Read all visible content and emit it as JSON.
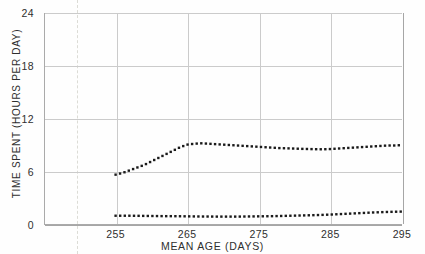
{
  "figure": {
    "background_color": "#fefefe",
    "grid_color": "#cbcbcb",
    "axis_color": "#a6a6a6",
    "series_color": "#1a1a1a",
    "marker_line_color": "#dcdcd6"
  },
  "axes": {
    "y_title": "TIME SPENT (HOURS PER DAY)",
    "x_title": "MEAN AGE (DAYS)",
    "y_ticks": [
      "0",
      "6",
      "12",
      "18",
      "24"
    ],
    "x_ticks": [
      "255",
      "265",
      "275",
      "285",
      "295"
    ]
  },
  "chart_data": {
    "type": "line",
    "title": "",
    "subtitle": "",
    "xlabel": "MEAN AGE (DAYS)",
    "ylabel": "TIME SPENT (HOURS PER DAY)",
    "xlim": [
      245,
      295
    ],
    "ylim": [
      0,
      24
    ],
    "xticks": [
      255,
      265,
      275,
      285,
      295
    ],
    "yticks": [
      0,
      6,
      12,
      18,
      24
    ],
    "grid": true,
    "legend": false,
    "legend_position": "none",
    "line_style": "dotted",
    "annotations": [
      {
        "type": "vertical-dashed-line",
        "x": 249,
        "label": "",
        "color": "#dcdcd6"
      }
    ],
    "series": [
      {
        "name": "upper-series",
        "style": "dotted",
        "color": "#1a1a1a",
        "x": [
          255,
          256,
          257,
          258,
          259,
          260,
          261,
          262,
          263,
          264,
          265,
          266,
          267,
          268,
          269,
          270,
          271,
          272,
          273,
          274,
          275,
          276,
          277,
          278,
          279,
          280,
          281,
          282,
          283,
          284,
          285,
          286,
          287,
          288,
          289,
          290,
          291,
          292,
          293,
          294,
          295
        ],
        "values": [
          5.7,
          5.9,
          6.2,
          6.5,
          6.8,
          7.2,
          7.6,
          8.0,
          8.4,
          8.8,
          9.1,
          9.2,
          9.25,
          9.2,
          9.15,
          9.1,
          9.05,
          9.0,
          8.95,
          8.9,
          8.85,
          8.8,
          8.75,
          8.7,
          8.68,
          8.65,
          8.62,
          8.6,
          8.58,
          8.57,
          8.6,
          8.65,
          8.7,
          8.75,
          8.8,
          8.85,
          8.9,
          8.95,
          9.0,
          9.0,
          9.05
        ]
      },
      {
        "name": "lower-series",
        "style": "dotted",
        "color": "#1a1a1a",
        "x": [
          255,
          256,
          257,
          258,
          259,
          260,
          261,
          262,
          263,
          264,
          265,
          266,
          267,
          268,
          269,
          270,
          271,
          272,
          273,
          274,
          275,
          276,
          277,
          278,
          279,
          280,
          281,
          282,
          283,
          284,
          285,
          286,
          287,
          288,
          289,
          290,
          291,
          292,
          293,
          294,
          295
        ],
        "values": [
          1.05,
          1.05,
          1.05,
          1.04,
          1.03,
          1.02,
          1.01,
          1.0,
          1.0,
          0.99,
          0.98,
          0.97,
          0.96,
          0.96,
          0.95,
          0.95,
          0.95,
          0.95,
          0.96,
          0.97,
          0.98,
          0.99,
          1.0,
          1.02,
          1.04,
          1.06,
          1.08,
          1.1,
          1.12,
          1.15,
          1.18,
          1.22,
          1.26,
          1.3,
          1.34,
          1.38,
          1.42,
          1.45,
          1.48,
          1.5,
          1.52
        ]
      }
    ]
  }
}
